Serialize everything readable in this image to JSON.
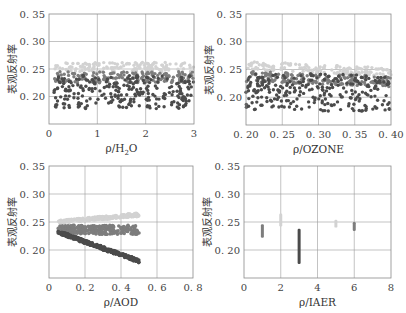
{
  "colors": {
    "series_light": "#d2d2d2",
    "series_mid": "#7d7d7d",
    "series_dark": "#4b4b4b",
    "grid": "#9a9a9a",
    "frame": "#8a8a8a"
  },
  "chart_data": [
    {
      "type": "scatter",
      "title": "",
      "xlabel": "ρ/H₂O",
      "xlabel_main": "ρ/H",
      "xlabel_sub": "2",
      "xlabel_tail": "O",
      "ylabel": "表观反射率",
      "xlim": [
        0,
        3
      ],
      "ylim": [
        0.15,
        0.35
      ],
      "xticks": [
        0,
        1,
        2,
        3
      ],
      "xtick_labels": [
        "0",
        "1",
        "2",
        "3"
      ],
      "yticks": [
        0.2,
        0.25,
        0.3,
        0.35
      ],
      "ytick_labels": [
        "0. 20",
        "0. 25",
        "0. 30",
        "0. 35"
      ],
      "grid": true,
      "series": [
        {
          "name": "light",
          "color_key": "series_light",
          "x_range": [
            0.1,
            3.0
          ],
          "y_range": [
            0.245,
            0.262
          ],
          "n": 140,
          "trend": 0
        },
        {
          "name": "mid",
          "color_key": "series_mid",
          "x_range": [
            0.1,
            3.0
          ],
          "y_range": [
            0.225,
            0.245
          ],
          "n": 170,
          "trend": 0
        },
        {
          "name": "dark",
          "color_key": "series_dark",
          "x_range": [
            0.1,
            3.0
          ],
          "y_range": [
            0.178,
            0.24
          ],
          "n": 260,
          "trend": 0
        }
      ]
    },
    {
      "type": "scatter",
      "title": "",
      "xlabel": "ρ/OZONE",
      "ylabel": "表观反射率",
      "xlim": [
        0.2,
        0.4
      ],
      "ylim": [
        0.15,
        0.35
      ],
      "xticks": [
        0.2,
        0.25,
        0.3,
        0.35,
        0.4
      ],
      "xtick_labels": [
        "0. 20",
        "0. 25",
        "0. 30",
        "0. 35",
        "0. 40"
      ],
      "yticks": [
        0.2,
        0.25,
        0.3,
        0.35
      ],
      "ytick_labels": [
        "0. 20",
        "0. 25",
        "0. 30",
        "0. 35"
      ],
      "grid": true,
      "series": [
        {
          "name": "light",
          "color_key": "series_light",
          "x_range": [
            0.2,
            0.4
          ],
          "y_range": [
            0.25,
            0.265
          ],
          "n": 140,
          "trend": -0.04
        },
        {
          "name": "mid",
          "color_key": "series_mid",
          "x_range": [
            0.2,
            0.4
          ],
          "y_range": [
            0.228,
            0.247
          ],
          "n": 170,
          "trend": -0.03
        },
        {
          "name": "dark",
          "color_key": "series_dark",
          "x_range": [
            0.2,
            0.4
          ],
          "y_range": [
            0.178,
            0.245
          ],
          "n": 260,
          "trend": -0.02
        }
      ]
    },
    {
      "type": "scatter",
      "title": "",
      "xlabel": "ρ/AOD",
      "ylabel": "表观反射率",
      "xlim": [
        0,
        0.8
      ],
      "ylim": [
        0.15,
        0.35
      ],
      "xticks": [
        0,
        0.2,
        0.4,
        0.6,
        0.8
      ],
      "xtick_labels": [
        "0",
        "0. 2",
        "0. 4",
        "0. 6",
        "0. 8"
      ],
      "yticks": [
        0.2,
        0.25,
        0.3,
        0.35
      ],
      "ytick_labels": [
        "0. 20",
        "0. 25",
        "0. 30",
        "0. 35"
      ],
      "grid": true,
      "series": [
        {
          "name": "light",
          "color_key": "series_light",
          "line": {
            "x0": 0.05,
            "y0": 0.25,
            "x1": 0.5,
            "y1": 0.263
          },
          "spread": 0.003,
          "n": 220
        },
        {
          "name": "mid",
          "color_key": "series_mid",
          "line": {
            "x0": 0.05,
            "y0": 0.236,
            "x1": 0.5,
            "y1": 0.236
          },
          "spread": 0.008,
          "n": 240
        },
        {
          "name": "dark",
          "color_key": "series_dark",
          "line": {
            "x0": 0.05,
            "y0": 0.232,
            "x1": 0.5,
            "y1": 0.18
          },
          "spread": 0.003,
          "n": 300
        }
      ]
    },
    {
      "type": "scatter",
      "title": "",
      "xlabel": "ρ/IAER",
      "ylabel": "表观反射率",
      "xlim": [
        0,
        8
      ],
      "ylim": [
        0.15,
        0.35
      ],
      "xticks": [
        0,
        2,
        4,
        6,
        8
      ],
      "xtick_labels": [
        "0",
        "2",
        "4",
        "6",
        "8"
      ],
      "yticks": [
        0.2,
        0.25,
        0.3,
        0.35
      ],
      "ytick_labels": [
        "0. 20",
        "0. 25",
        "0. 30",
        "0. 35"
      ],
      "grid": true,
      "series": [
        {
          "name": "IAER=1",
          "color_key": "series_mid",
          "x": 1,
          "y_range": [
            0.222,
            0.246
          ]
        },
        {
          "name": "IAER=2",
          "color_key": "series_light",
          "x": 2,
          "y_range": [
            0.242,
            0.265
          ]
        },
        {
          "name": "IAER=3",
          "color_key": "series_dark",
          "x": 3,
          "y_range": [
            0.175,
            0.238
          ]
        },
        {
          "name": "IAER=5",
          "color_key": "series_light",
          "x": 5,
          "y_range": [
            0.24,
            0.254
          ]
        },
        {
          "name": "IAER=6",
          "color_key": "series_mid",
          "x": 6,
          "y_range": [
            0.234,
            0.25
          ]
        }
      ]
    }
  ],
  "panels": [
    {
      "left": 49,
      "top": 14,
      "right": 194,
      "bottom": 124
    },
    {
      "left": 246,
      "top": 14,
      "right": 391,
      "bottom": 125
    },
    {
      "left": 49,
      "top": 166,
      "right": 193,
      "bottom": 278
    },
    {
      "left": 244,
      "top": 166,
      "right": 391,
      "bottom": 278
    }
  ]
}
